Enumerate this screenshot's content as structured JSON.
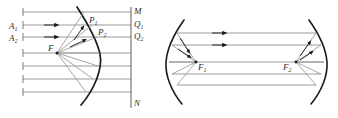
{
  "figure": {
    "panels": [
      {
        "id": "left-panel",
        "name": "single-parabolic-mirror",
        "description": "Parallel rays reflecting off a parabolic mirror to a focus F",
        "labels": {
          "focus": "F",
          "point_p1": "P",
          "point_p1_sub": "1",
          "point_p2": "P",
          "point_p2_sub": "2",
          "aperture_a1": "A",
          "aperture_a1_sub": "1",
          "aperture_a2": "A",
          "aperture_a2_sub": "2",
          "screen_top": "M",
          "screen_q1": "Q",
          "screen_q1_sub": "1",
          "screen_q2": "Q",
          "screen_q2_sub": "2",
          "screen_bottom": "N"
        },
        "ray_count": 7,
        "focus_position": {
          "x": 57,
          "y": 53
        },
        "vertex_position": {
          "x": 100,
          "y": 54
        },
        "screen_line_x": 131
      },
      {
        "id": "right-panel",
        "name": "confocal-parabolic-mirror-pair",
        "description": "Two facing parabolic mirrors with foci F1 and F2 exchanging parallel rays",
        "labels": {
          "focus_left": "F",
          "focus_left_sub": "1",
          "focus_right": "F",
          "focus_right_sub": "2"
        },
        "ray_count": 5,
        "focus_left_position": {
          "x": 196,
          "y": 62
        },
        "focus_right_position": {
          "x": 296,
          "y": 62
        }
      }
    ],
    "colors": {
      "background": "#ffffff",
      "ray": "#8a8a8a",
      "mirror": "#1a1a1a",
      "label": "#2b2b2b",
      "arrow": "#1a1a1a",
      "tick": "#6e6e6e"
    }
  }
}
